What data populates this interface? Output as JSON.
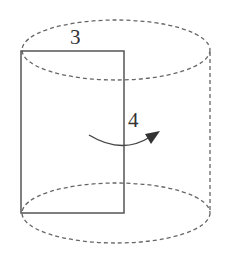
{
  "diagram": {
    "type": "rotation-of-rectangle-into-cylinder",
    "labels": {
      "width": "3",
      "height": "4"
    },
    "colors": {
      "stroke": "#555555",
      "dashed": "#666666",
      "arrow": "#333333"
    }
  }
}
